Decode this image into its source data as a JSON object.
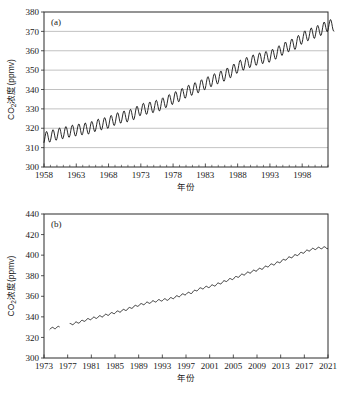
{
  "figure": {
    "panel_a_tag": "(a)",
    "panel_b_tag": "(b)",
    "xlabel_a": "年份",
    "xlabel_b": "年份",
    "ylabel_prefix": "CO",
    "ylabel_sub": "2",
    "ylabel_suffix": "浓度(ppmv)"
  },
  "chart_data": [
    {
      "type": "line",
      "panel": "(a)",
      "title": "",
      "xlabel": "年份",
      "ylabel": "CO2浓度(ppmv)",
      "xlim": [
        1958,
        2002
      ],
      "ylim": [
        300,
        380
      ],
      "ytick_step": 10,
      "xtick_step": 5,
      "grid": true,
      "grid_orientation": "horizontal",
      "xticks": [
        1958,
        1963,
        1968,
        1973,
        1978,
        1983,
        1988,
        1993,
        1998
      ],
      "yticks": [
        300,
        310,
        320,
        330,
        340,
        350,
        360,
        370,
        380
      ],
      "minor_xtick_interval": 1,
      "description": "Mauna Loa monthly mean CO2 with seasonal sawtooth oscillation, amplitude about 6 ppmv",
      "series": [
        {
          "name": "CO2 monthly mean",
          "seasonal_amplitude": 3.0,
          "annual_trend": [
            {
              "year": 1958,
              "value": 315.0
            },
            {
              "year": 1959,
              "value": 315.9
            },
            {
              "year": 1960,
              "value": 316.9
            },
            {
              "year": 1961,
              "value": 317.6
            },
            {
              "year": 1962,
              "value": 318.4
            },
            {
              "year": 1963,
              "value": 319.0
            },
            {
              "year": 1964,
              "value": 319.6
            },
            {
              "year": 1965,
              "value": 320.0
            },
            {
              "year": 1966,
              "value": 321.4
            },
            {
              "year": 1967,
              "value": 322.2
            },
            {
              "year": 1968,
              "value": 323.0
            },
            {
              "year": 1969,
              "value": 324.6
            },
            {
              "year": 1970,
              "value": 325.7
            },
            {
              "year": 1971,
              "value": 326.3
            },
            {
              "year": 1972,
              "value": 327.5
            },
            {
              "year": 1973,
              "value": 329.7
            },
            {
              "year": 1974,
              "value": 330.2
            },
            {
              "year": 1975,
              "value": 331.1
            },
            {
              "year": 1976,
              "value": 332.0
            },
            {
              "year": 1977,
              "value": 333.8
            },
            {
              "year": 1978,
              "value": 335.4
            },
            {
              "year": 1979,
              "value": 336.8
            },
            {
              "year": 1980,
              "value": 338.7
            },
            {
              "year": 1981,
              "value": 340.1
            },
            {
              "year": 1982,
              "value": 341.4
            },
            {
              "year": 1983,
              "value": 343.0
            },
            {
              "year": 1984,
              "value": 344.6
            },
            {
              "year": 1985,
              "value": 346.0
            },
            {
              "year": 1986,
              "value": 347.4
            },
            {
              "year": 1987,
              "value": 349.2
            },
            {
              "year": 1988,
              "value": 351.6
            },
            {
              "year": 1989,
              "value": 353.1
            },
            {
              "year": 1990,
              "value": 354.4
            },
            {
              "year": 1991,
              "value": 355.6
            },
            {
              "year": 1992,
              "value": 356.4
            },
            {
              "year": 1993,
              "value": 357.1
            },
            {
              "year": 1994,
              "value": 358.8
            },
            {
              "year": 1995,
              "value": 360.8
            },
            {
              "year": 1996,
              "value": 362.6
            },
            {
              "year": 1997,
              "value": 363.8
            },
            {
              "year": 1998,
              "value": 366.6
            },
            {
              "year": 1999,
              "value": 368.3
            },
            {
              "year": 2000,
              "value": 369.5
            },
            {
              "year": 2001,
              "value": 371.0
            },
            {
              "year": 2002,
              "value": 373.1
            }
          ]
        }
      ]
    },
    {
      "type": "line",
      "panel": "(b)",
      "title": "",
      "xlabel": "年份",
      "ylabel": "CO2浓度(ppmv)",
      "xlim": [
        1973,
        2021
      ],
      "ylim": [
        300,
        440
      ],
      "ytick_step": 20,
      "xtick_step": 4,
      "grid": false,
      "xticks": [
        1973,
        1977,
        1981,
        1985,
        1989,
        1993,
        1997,
        2001,
        2005,
        2009,
        2013,
        2017,
        2021
      ],
      "yticks": [
        300,
        320,
        340,
        360,
        380,
        400,
        420,
        440
      ],
      "minor_xtick_interval": 4,
      "description": "Global mean CO2 concentration with small seasonal ripple; data gap between about 1975.5 and 1977.5",
      "data_gaps": [
        [
          1975.6,
          1977.4
        ]
      ],
      "series": [
        {
          "name": "CO2 global mean",
          "seasonal_amplitude": 0.9,
          "annual_trend": [
            {
              "year": 1974,
              "value": 328.5
            },
            {
              "year": 1975,
              "value": 329.5
            },
            {
              "year": 1976,
              "value": 330.4
            },
            {
              "year": 1977,
              "value": 332.0
            },
            {
              "year": 1978,
              "value": 333.5
            },
            {
              "year": 1979,
              "value": 335.0
            },
            {
              "year": 1980,
              "value": 336.8
            },
            {
              "year": 1981,
              "value": 338.3
            },
            {
              "year": 1982,
              "value": 339.6
            },
            {
              "year": 1983,
              "value": 341.0
            },
            {
              "year": 1984,
              "value": 342.6
            },
            {
              "year": 1985,
              "value": 344.2
            },
            {
              "year": 1986,
              "value": 345.7
            },
            {
              "year": 1987,
              "value": 347.3
            },
            {
              "year": 1988,
              "value": 349.5
            },
            {
              "year": 1989,
              "value": 351.4
            },
            {
              "year": 1990,
              "value": 352.9
            },
            {
              "year": 1991,
              "value": 354.2
            },
            {
              "year": 1992,
              "value": 355.5
            },
            {
              "year": 1993,
              "value": 356.4
            },
            {
              "year": 1994,
              "value": 357.1
            },
            {
              "year": 1995,
              "value": 358.8
            },
            {
              "year": 1996,
              "value": 360.7
            },
            {
              "year": 1997,
              "value": 362.5
            },
            {
              "year": 1998,
              "value": 363.7
            },
            {
              "year": 1999,
              "value": 366.6
            },
            {
              "year": 2000,
              "value": 368.3
            },
            {
              "year": 2001,
              "value": 369.5
            },
            {
              "year": 2002,
              "value": 371.1
            },
            {
              "year": 2003,
              "value": 373.2
            },
            {
              "year": 2004,
              "value": 375.6
            },
            {
              "year": 2005,
              "value": 377.4
            },
            {
              "year": 2006,
              "value": 379.7
            },
            {
              "year": 2007,
              "value": 381.9
            },
            {
              "year": 2008,
              "value": 383.7
            },
            {
              "year": 2009,
              "value": 385.6
            },
            {
              "year": 2010,
              "value": 387.4
            },
            {
              "year": 2011,
              "value": 389.8
            },
            {
              "year": 2012,
              "value": 391.6
            },
            {
              "year": 2013,
              "value": 393.8
            },
            {
              "year": 2014,
              "value": 396.5
            },
            {
              "year": 2015,
              "value": 398.6
            },
            {
              "year": 2016,
              "value": 400.8
            },
            {
              "year": 2017,
              "value": 403.1
            },
            {
              "year": 2018,
              "value": 405.2
            },
            {
              "year": 2019,
              "value": 406.5
            },
            {
              "year": 2020,
              "value": 407.2
            }
          ]
        }
      ]
    }
  ]
}
